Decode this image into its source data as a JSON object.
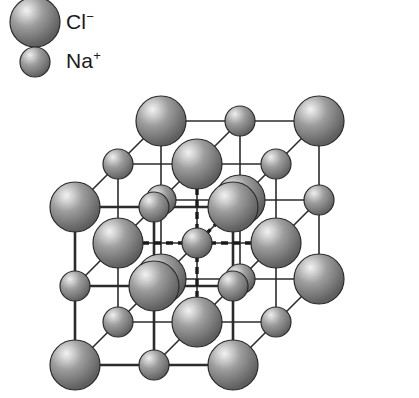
{
  "figure": {
    "background_color": "#ffffff"
  },
  "legend": {
    "items": [
      {
        "id": "chloride",
        "symbol": "Cl",
        "charge": "−",
        "label": "Cl⁻",
        "species": "chloride-ion",
        "radius_px": 25,
        "sphere_color": "#8a8a8a",
        "highlight_color": "#f0f0f0",
        "edge_color": "#2b2b2b",
        "center": {
          "x": 35,
          "y": 22
        },
        "label_pos": {
          "x": 66,
          "y": 11
        }
      },
      {
        "id": "sodium",
        "symbol": "Na",
        "charge": "+",
        "label": "Na⁺",
        "species": "sodium-ion",
        "radius_px": 15,
        "sphere_color": "#8a8a8a",
        "highlight_color": "#f0f0f0",
        "edge_color": "#2b2b2b",
        "center": {
          "x": 35,
          "y": 62
        },
        "label_pos": {
          "x": 66,
          "y": 50
        }
      }
    ]
  },
  "lattice": {
    "type": "rock-salt",
    "grid": {
      "nx": 3,
      "ny": 3,
      "nz": 3
    },
    "origin": {
      "x": 75,
      "y": 365
    },
    "step_x": 79,
    "step_y": -79,
    "depth_dx": 43,
    "depth_dy": -43,
    "corner_species": "chloride",
    "bond_color": "#2b2b2b",
    "bond_width": 1.6,
    "front_bond_width": 2.6,
    "dashed_color": "#1a1a1a",
    "dashed_width": 3.4,
    "dash_pattern": "7,5",
    "coordination_center": {
      "i": 1,
      "j": 1,
      "k": 1
    },
    "coordination_note": "octahedral 6-coordinate dashed markers from central Cl⁻",
    "radius_large": 25,
    "radius_small": 15
  }
}
